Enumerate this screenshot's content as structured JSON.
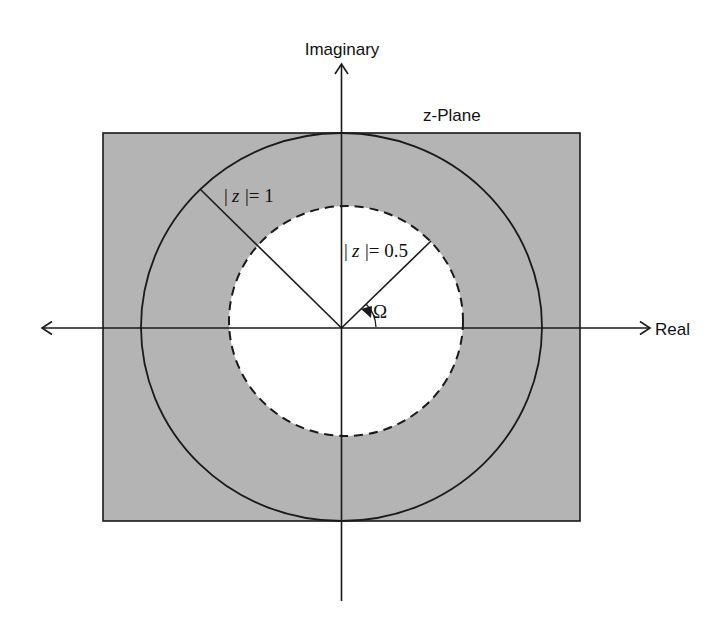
{
  "diagram": {
    "title": "z-Plane",
    "axes": {
      "x_label": "Real",
      "y_label": "Imaginary"
    },
    "regions": {
      "shaded_color": "#b4b4b4",
      "background_color": "#ffffff",
      "description": "Shaded rectangle with white interior disk |z| < 0.5"
    },
    "circles": [
      {
        "name": "unit-circle",
        "radius": 1,
        "label": "|z|=1",
        "style": "solid"
      },
      {
        "name": "half-circle",
        "radius": 0.5,
        "label": "|z|=0.5",
        "style": "dashed"
      }
    ],
    "labels": {
      "unit_circle_bar_left": "|",
      "unit_circle_var": "z",
      "unit_circle_rest": "|= 1",
      "half_circle_bar_left": "|",
      "half_circle_var": "z",
      "half_circle_rest": "|= 0.5",
      "angle": "Ω"
    },
    "colors": {
      "line": "#1a1a1a",
      "shade": "#b4b4b4"
    }
  }
}
